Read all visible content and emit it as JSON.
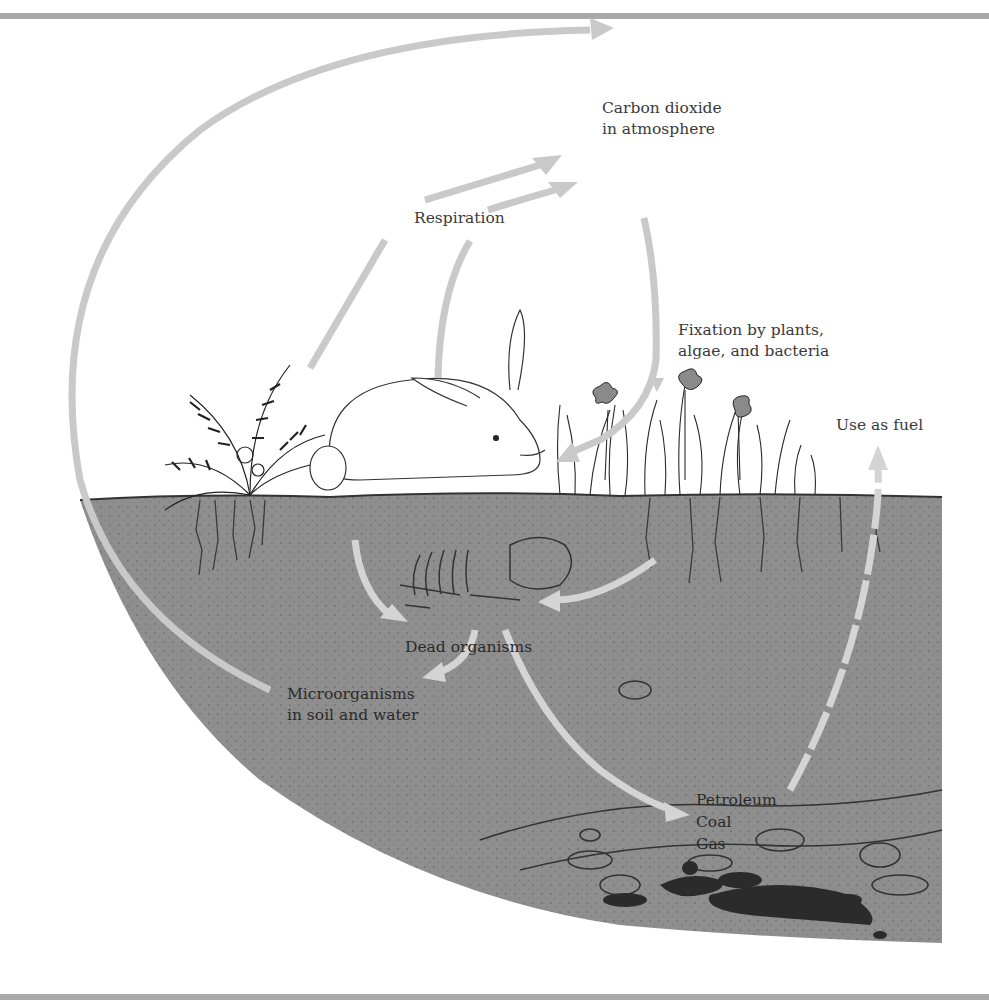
{
  "diagram": {
    "topic": "Carbon cycle",
    "labels": {
      "atmosphere": "Carbon dioxide\nin atmosphere",
      "respiration": "Respiration",
      "fixation": "Fixation by plants,\nalgae, and bacteria",
      "fuel": "Use as fuel",
      "dead": "Dead organisms",
      "microbes": "Microorganisms\nin soil and water",
      "fossil_1": "Petroleum",
      "fossil_2": "Coal",
      "fossil_3": "Gas"
    },
    "illustrations": [
      "fern",
      "rabbit",
      "grass-and-flowers",
      "buried-skeleton",
      "rock-strata",
      "fossil-fuel-deposits"
    ],
    "flows": [
      {
        "from": "Microorganisms in soil and water",
        "to": "Carbon dioxide in atmosphere",
        "style": "solid"
      },
      {
        "from": "Fern (plants)",
        "to": "Carbon dioxide in atmosphere",
        "label": "Respiration",
        "style": "solid"
      },
      {
        "from": "Rabbit (animals)",
        "to": "Carbon dioxide in atmosphere",
        "label": "Respiration",
        "style": "solid"
      },
      {
        "from": "Carbon dioxide in atmosphere",
        "to": "Plants",
        "label": "Fixation by plants, algae, and bacteria",
        "style": "solid"
      },
      {
        "from": "Rabbit",
        "to": "Dead organisms",
        "style": "solid"
      },
      {
        "from": "Plants",
        "to": "Dead organisms",
        "style": "solid"
      },
      {
        "from": "Dead organisms",
        "to": "Microorganisms in soil and water",
        "style": "solid"
      },
      {
        "from": "Dead organisms",
        "to": "Petroleum / Coal / Gas",
        "style": "solid"
      },
      {
        "from": "Petroleum / Coal / Gas",
        "to": "Carbon dioxide in atmosphere",
        "label": "Use as fuel",
        "style": "dashed"
      }
    ],
    "colors": {
      "rule": "#a9a9a9",
      "soil": "#8e8e8e",
      "arrow_above": "#c9c9c9",
      "arrow_below": "#d4d4d4",
      "ink": "#2a2a2a",
      "fuel_deposit": "#2b2b2b"
    }
  }
}
